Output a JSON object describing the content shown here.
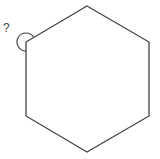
{
  "diagram": {
    "shape": "regular hexagon",
    "vertices": [
      [
        87,
        6
      ],
      [
        149,
        42
      ],
      [
        149,
        116
      ],
      [
        87,
        152
      ],
      [
        26,
        116
      ],
      [
        26,
        42
      ]
    ],
    "stroke_color": "#444444",
    "angle_marker": {
      "vertex": [
        26,
        42
      ],
      "type": "reflex angle arc",
      "label": "?"
    }
  }
}
